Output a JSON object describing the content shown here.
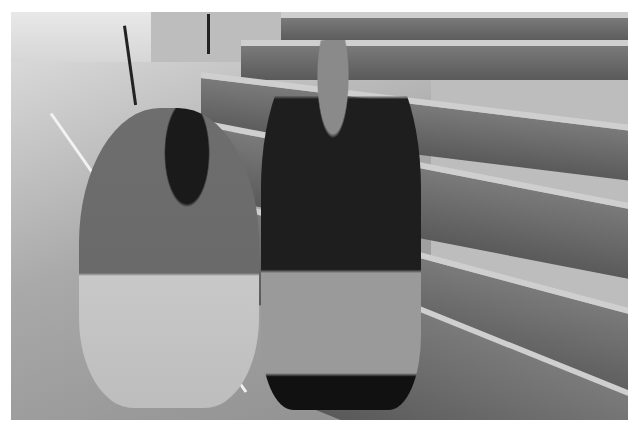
{
  "image": {
    "description": "Black-and-white photograph in a gymnasium: a kneeling man in a polo shirt tapes or examines the ankle/knee of a seated young athlete in a sleeveless jersey and shorts on retracted wooden bleachers. Seat numbers are visible on bleacher risers.",
    "tone": "grayscale",
    "colors": {
      "border": "#ffffff",
      "bleacher_riser": "#5f5f5f",
      "bleacher_seat": "#cfcfcf",
      "floor": "#a8a8a8",
      "court_line": "#f2f2f2",
      "clothing_dark": "#1e1e1e"
    }
  },
  "scene": {
    "subjects": [
      {
        "role": "trainer",
        "pose": "kneeling",
        "clothing": "polo shirt, shorts, sneakers"
      },
      {
        "role": "athlete",
        "pose": "seated on bleacher",
        "clothing": "sleeveless jersey, shorts, black sneakers",
        "holding": "water bottle"
      }
    ],
    "setting": "gymnasium bleachers and hardwood court",
    "visible_seat_labels": [
      "11",
      "12",
      "13",
      "14"
    ]
  }
}
